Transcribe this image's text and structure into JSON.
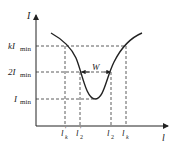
{
  "diagram": {
    "type": "resonance-curve",
    "axes": {
      "y_label": "I",
      "x_label": "l"
    },
    "y_levels": [
      {
        "label_main": "kI",
        "label_sub": "min",
        "value": "kImin"
      },
      {
        "label_main": "2I",
        "label_sub": "min",
        "value": "2Imin"
      },
      {
        "label_main": "I",
        "label_sub": "min",
        "value": "Imin"
      }
    ],
    "x_marks": [
      {
        "label_main": "l",
        "label_sup": "′",
        "label_sub": "k"
      },
      {
        "label_main": "l",
        "label_sup": "′",
        "label_sub": "2"
      },
      {
        "label_main": "l",
        "label_sup": "",
        "label_sub": "2"
      },
      {
        "label_main": "l",
        "label_sup": "",
        "label_sub": "k"
      }
    ],
    "width_marker": "W",
    "colors": {
      "line": "#222222",
      "background": "#ffffff"
    }
  }
}
